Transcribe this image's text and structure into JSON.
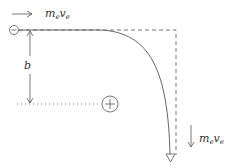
{
  "diagram": {
    "type": "electron scattering trajectory",
    "labels": {
      "momentum_initial": {
        "base": "m",
        "sub1": "e",
        "base2": "v",
        "sub2": "e"
      },
      "momentum_final": {
        "base": "m",
        "sub1": "e",
        "base2": "v",
        "sub2": "e"
      },
      "impact_parameter": "b"
    },
    "charges": {
      "electron": "−",
      "nucleus": "+"
    },
    "colors": {
      "stroke": "#555555",
      "text": "#333333"
    }
  }
}
